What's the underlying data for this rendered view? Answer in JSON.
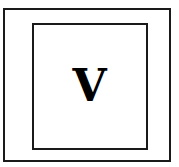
{
  "diagram": {
    "letter": "V",
    "stroke_color": "#1a1a1a",
    "text_color": "#000000",
    "background": "#ffffff"
  }
}
